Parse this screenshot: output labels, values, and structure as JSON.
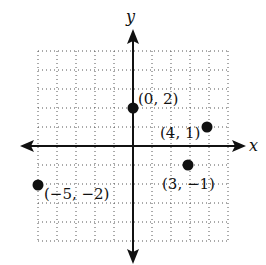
{
  "chart_data": {
    "type": "scatter",
    "title": "",
    "xlabel": "x",
    "ylabel": "y",
    "xlim": [
      -5,
      5
    ],
    "ylim": [
      -5,
      5
    ],
    "grid": true,
    "grid_style": "dotted",
    "tick_labels_shown": false,
    "points": [
      {
        "x": 0,
        "y": 2,
        "label": "(0, 2)"
      },
      {
        "x": 4,
        "y": 1,
        "label": "(4, 1)"
      },
      {
        "x": 3,
        "y": -1,
        "label": "(3, −1)"
      },
      {
        "x": -5,
        "y": -2,
        "label": "(−5, −2)"
      }
    ]
  },
  "colors": {
    "ink": "#111111",
    "grid": "#555555",
    "background": "#ffffff"
  }
}
